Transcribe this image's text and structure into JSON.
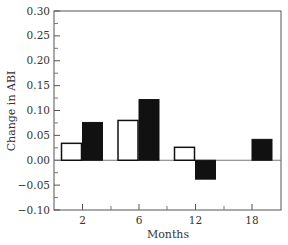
{
  "chart_data": {
    "type": "bar",
    "title": "",
    "xlabel": "Months",
    "ylabel": "Change in ABI",
    "categories": [
      "2",
      "6",
      "12",
      "18"
    ],
    "series": [
      {
        "name": "Group A (open bars)",
        "fill": "#ffffff",
        "stroke": "#111111",
        "values": [
          0.034,
          0.08,
          0.026,
          0.0
        ]
      },
      {
        "name": "Group B (filled bars)",
        "fill": "#111111",
        "stroke": "#111111",
        "values": [
          0.076,
          0.122,
          -0.038,
          0.042
        ]
      }
    ],
    "ylim": [
      -0.1,
      0.3
    ],
    "yticks": [
      -0.1,
      -0.05,
      0.0,
      0.05,
      0.1,
      0.15,
      0.2,
      0.25,
      0.3
    ],
    "ytick_labels": [
      "−0.10",
      "−0.05",
      "0.00",
      "0.05",
      "0.10",
      "0.15",
      "0.20",
      "0.25",
      "0.30"
    ],
    "grid": false,
    "legend": null,
    "zero_line": true
  }
}
